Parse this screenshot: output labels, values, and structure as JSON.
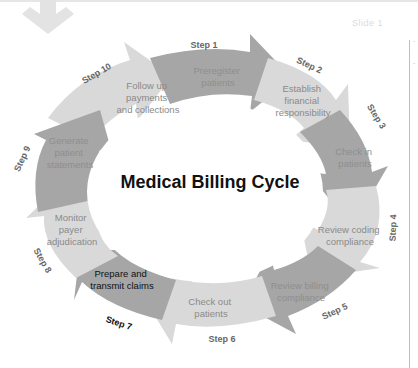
{
  "header": {
    "faint_title": "Slide 1",
    "down_arrow_icon": "arrow-down-icon"
  },
  "diagram": {
    "title": "Medical Billing Cycle",
    "colors": {
      "dark": "#a6a6a6",
      "light": "#d9d9d9",
      "text_on_dark": "#8e8e8e",
      "text_on_light": "#8a8a8a",
      "step_label": "#666666",
      "highlight_text": "#111111"
    },
    "steps": [
      {
        "step": "Step 1",
        "label_lines": [
          "Preregister",
          "patients"
        ],
        "shade": "dark"
      },
      {
        "step": "Step 2",
        "label_lines": [
          "Establish",
          "financial",
          "responsibility"
        ],
        "shade": "light"
      },
      {
        "step": "Step 3",
        "label_lines": [
          "Check in",
          "patients"
        ],
        "shade": "dark"
      },
      {
        "step": "Step 4",
        "label_lines": [
          "Review coding",
          "compliance"
        ],
        "shade": "light"
      },
      {
        "step": "Step 5",
        "label_lines": [
          "Review billing",
          "compliance"
        ],
        "shade": "dark"
      },
      {
        "step": "Step 6",
        "label_lines": [
          "Check out",
          "patients"
        ],
        "shade": "light"
      },
      {
        "step": "Step 7",
        "label_lines": [
          "Prepare and",
          "transmit claims"
        ],
        "shade": "dark",
        "highlighted": true
      },
      {
        "step": "Step 8",
        "label_lines": [
          "Monitor",
          "payer",
          "adjudication"
        ],
        "shade": "light"
      },
      {
        "step": "Step 9",
        "label_lines": [
          "Generate",
          "patient",
          "statements"
        ],
        "shade": "dark"
      },
      {
        "step": "Step 10",
        "label_lines": [
          "Follow up",
          "payments",
          "and collections"
        ],
        "shade": "light"
      }
    ]
  }
}
